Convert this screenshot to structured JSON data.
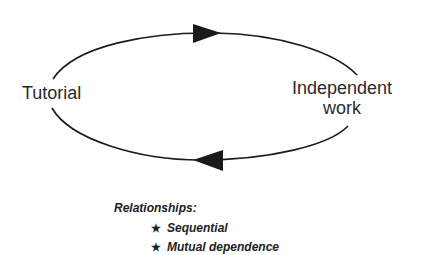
{
  "diagram": {
    "type": "cycle",
    "nodes": [
      {
        "id": "tutorial",
        "label": "Tutorial"
      },
      {
        "id": "independent_work",
        "label_line1": "Independent",
        "label_line2": "work"
      }
    ],
    "edges": [
      {
        "from": "tutorial",
        "to": "independent_work",
        "direction": "clockwise-top"
      },
      {
        "from": "independent_work",
        "to": "tutorial",
        "direction": "clockwise-bottom"
      }
    ],
    "stroke_color": "#1a1a1a"
  },
  "legend": {
    "title": "Relationships:",
    "bullet_icon": "★",
    "items": [
      {
        "label": "Sequential"
      },
      {
        "label": "Mutual dependence"
      }
    ]
  }
}
